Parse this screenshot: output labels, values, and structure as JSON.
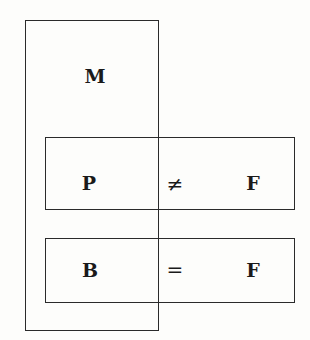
{
  "diagram": {
    "type": "set-overlap-boxes",
    "boxes": [
      {
        "id": "M",
        "label": "M"
      },
      {
        "id": "P-F",
        "left": "P",
        "relation": "≠",
        "right": "F"
      },
      {
        "id": "B-F",
        "left": "B",
        "relation": "=",
        "right": "F"
      }
    ],
    "labels": {
      "m": "M",
      "p": "P",
      "neq": "≠",
      "f1": "F",
      "b": "B",
      "eq": "=",
      "f2": "F"
    }
  }
}
